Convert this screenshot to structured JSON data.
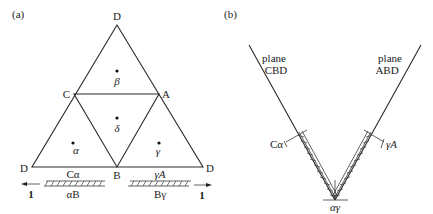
{
  "panels": [
    {
      "id": "a",
      "label": "(a)",
      "vertices": {
        "top": "D",
        "left_mid": "C",
        "right_mid": "A",
        "bottom_left": "D",
        "bottom_mid": "B",
        "bottom_right": "D"
      },
      "regions": {
        "top": "β",
        "center": "δ",
        "left": "α",
        "right": "γ"
      },
      "bars": {
        "left": {
          "top_label": "Cα",
          "bottom_label": "αB",
          "arrow_label": "1"
        },
        "right": {
          "top_label": "γA",
          "bottom_label": "Bγ",
          "arrow_label": "1"
        }
      }
    },
    {
      "id": "b",
      "label": "(b)",
      "left_plane": {
        "line1": "plane",
        "line2": "CBD",
        "marker": "Cα"
      },
      "right_plane": {
        "line1": "plane",
        "line2": "ABD",
        "marker": "γA"
      },
      "vertex_label": "αγ"
    }
  ]
}
